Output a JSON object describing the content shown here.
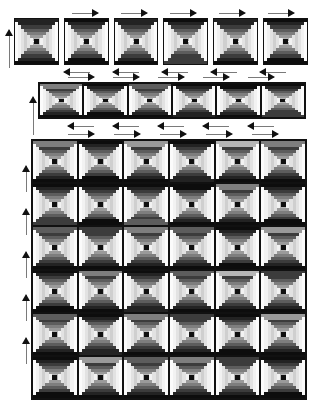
{
  "document": {
    "title": "Courthouse Steps Quilt Layout",
    "background": "#ffffff",
    "width": 321,
    "height": 408
  },
  "palette": {
    "outline": "#111111",
    "rule": "#7a7a7a",
    "tones": {
      "t0": "#f2f2f2",
      "t1": "#e2e2e2",
      "t2": "#cfcfcf",
      "t3": "#b5b5b5",
      "t4": "#9a9a9a",
      "t5": "#7e7e7e",
      "t6": "#5d5d5d",
      "t7": "#3c3c3c",
      "t8": "#232323",
      "t9": "#0d0d0d",
      "white": "#fbfbfb",
      "black": "#101010"
    }
  },
  "legend": {
    "block_style": "courthouse-steps",
    "ring_count": 7,
    "center_label": "center-square"
  },
  "panels": [
    {
      "id": "top-strip",
      "name": "block-preview-row",
      "x": 14,
      "y": 18,
      "w": 294,
      "h": 47,
      "cols": 6,
      "rows": 1,
      "gap": 5,
      "framed": false,
      "blocks": [
        {
          "i": 0,
          "dark": "t8",
          "light": "t2",
          "flip": "down"
        },
        {
          "i": 1,
          "dark": "t9",
          "light": "t1",
          "flip": "up"
        },
        {
          "i": 2,
          "dark": "t8",
          "light": "t2",
          "flip": "down"
        },
        {
          "i": 3,
          "dark": "t7",
          "light": "t1",
          "flip": "up"
        },
        {
          "i": 4,
          "dark": "t8",
          "light": "t2",
          "flip": "down"
        },
        {
          "i": 5,
          "dark": "t9",
          "light": "t1",
          "flip": "up"
        }
      ],
      "arrows_top": [
        {
          "x": 72,
          "y": 9,
          "w": 26,
          "dir": "right"
        },
        {
          "x": 121,
          "y": 9,
          "w": 26,
          "dir": "right"
        },
        {
          "x": 170,
          "y": 9,
          "w": 26,
          "dir": "right"
        },
        {
          "x": 219,
          "y": 9,
          "w": 26,
          "dir": "right"
        },
        {
          "x": 268,
          "y": 9,
          "w": 26,
          "dir": "right"
        }
      ],
      "arrows_bottom": [
        {
          "x": 64,
          "y": 68,
          "w": 26,
          "dir": "left"
        },
        {
          "x": 113,
          "y": 68,
          "w": 26,
          "dir": "left"
        },
        {
          "x": 162,
          "y": 68,
          "w": 26,
          "dir": "left"
        },
        {
          "x": 211,
          "y": 68,
          "w": 26,
          "dir": "left"
        },
        {
          "x": 260,
          "y": 68,
          "w": 26,
          "dir": "left"
        }
      ],
      "arrows_left": [
        {
          "x": 5,
          "y": 30,
          "h": 38,
          "dir": "up"
        }
      ]
    },
    {
      "id": "middle-strip",
      "name": "row-assembly-strip",
      "x": 38,
      "y": 82,
      "w": 268,
      "h": 37,
      "cols": 6,
      "rows": 1,
      "gap": 0,
      "framed": true,
      "blocks": [
        {
          "i": 0,
          "dark": "t5",
          "light": "t1",
          "flip": "down"
        },
        {
          "i": 1,
          "dark": "t9",
          "light": "t0",
          "flip": "up"
        },
        {
          "i": 2,
          "dark": "t6",
          "light": "t1",
          "flip": "down"
        },
        {
          "i": 3,
          "dark": "t8",
          "light": "t0",
          "flip": "up"
        },
        {
          "i": 4,
          "dark": "t9",
          "light": "t1",
          "flip": "down"
        },
        {
          "i": 5,
          "dark": "t7",
          "light": "t0",
          "flip": "up"
        }
      ],
      "arrows_top": [
        {
          "x": 68,
          "y": 73,
          "w": 26,
          "dir": "right"
        },
        {
          "x": 113,
          "y": 73,
          "w": 26,
          "dir": "right"
        },
        {
          "x": 158,
          "y": 73,
          "w": 26,
          "dir": "right"
        },
        {
          "x": 203,
          "y": 73,
          "w": 26,
          "dir": "right"
        },
        {
          "x": 248,
          "y": 73,
          "w": 26,
          "dir": "right"
        }
      ],
      "arrows_bottom": [
        {
          "x": 68,
          "y": 122,
          "w": 26,
          "dir": "left"
        },
        {
          "x": 113,
          "y": 122,
          "w": 26,
          "dir": "left"
        },
        {
          "x": 158,
          "y": 122,
          "w": 26,
          "dir": "left"
        },
        {
          "x": 203,
          "y": 122,
          "w": 26,
          "dir": "left"
        },
        {
          "x": 248,
          "y": 122,
          "w": 26,
          "dir": "left"
        }
      ],
      "arrows_left": [
        {
          "x": 29,
          "y": 97,
          "h": 38,
          "dir": "up"
        }
      ]
    },
    {
      "id": "main-grid",
      "name": "quilt-layout-grid",
      "x": 31,
      "y": 139,
      "w": 276,
      "h": 261,
      "cols": 6,
      "rows": 6,
      "gap": 0,
      "framed": true,
      "blocks": [
        {
          "i": 0,
          "dark": "t5",
          "light": "t1",
          "flip": "down"
        },
        {
          "i": 1,
          "dark": "t9",
          "light": "t0",
          "flip": "up"
        },
        {
          "i": 2,
          "dark": "t4",
          "light": "t1",
          "flip": "down"
        },
        {
          "i": 3,
          "dark": "t8",
          "light": "t0",
          "flip": "up"
        },
        {
          "i": 4,
          "dark": "t3",
          "light": "t1",
          "flip": "down"
        },
        {
          "i": 5,
          "dark": "t5",
          "light": "t0",
          "flip": "down"
        },
        {
          "i": 6,
          "dark": "t7",
          "light": "t0",
          "flip": "up"
        },
        {
          "i": 7,
          "dark": "t9",
          "light": "t1",
          "flip": "up"
        },
        {
          "i": 8,
          "dark": "t6",
          "light": "t0",
          "flip": "up"
        },
        {
          "i": 9,
          "dark": "t9",
          "light": "t1",
          "flip": "down"
        },
        {
          "i": 10,
          "dark": "t5",
          "light": "t0",
          "flip": "down"
        },
        {
          "i": 11,
          "dark": "t9",
          "light": "t1",
          "flip": "up"
        },
        {
          "i": 12,
          "dark": "t6",
          "light": "t1",
          "flip": "down"
        },
        {
          "i": 13,
          "dark": "t7",
          "light": "t0",
          "flip": "down"
        },
        {
          "i": 14,
          "dark": "t5",
          "light": "t1",
          "flip": "down"
        },
        {
          "i": 15,
          "dark": "t6",
          "light": "t0",
          "flip": "down"
        },
        {
          "i": 16,
          "dark": "t9",
          "light": "t1",
          "flip": "up"
        },
        {
          "i": 17,
          "dark": "t4",
          "light": "t0",
          "flip": "down"
        },
        {
          "i": 18,
          "dark": "t9",
          "light": "t0",
          "flip": "up"
        },
        {
          "i": 19,
          "dark": "t5",
          "light": "t1",
          "flip": "down"
        },
        {
          "i": 20,
          "dark": "t8",
          "light": "t0",
          "flip": "up"
        },
        {
          "i": 21,
          "dark": "t6",
          "light": "t1",
          "flip": "down"
        },
        {
          "i": 22,
          "dark": "t3",
          "light": "t0",
          "flip": "down"
        },
        {
          "i": 23,
          "dark": "t7",
          "light": "t1",
          "flip": "down"
        },
        {
          "i": 24,
          "dark": "t6",
          "light": "t0",
          "flip": "down"
        },
        {
          "i": 25,
          "dark": "t8",
          "light": "t1",
          "flip": "up"
        },
        {
          "i": 26,
          "dark": "t5",
          "light": "t0",
          "flip": "down"
        },
        {
          "i": 27,
          "dark": "t7",
          "light": "t1",
          "flip": "down"
        },
        {
          "i": 28,
          "dark": "t9",
          "light": "t0",
          "flip": "up"
        },
        {
          "i": 29,
          "dark": "t4",
          "light": "t1",
          "flip": "down"
        },
        {
          "i": 30,
          "dark": "t9",
          "light": "t0",
          "flip": "up"
        },
        {
          "i": 31,
          "dark": "t4",
          "light": "t1",
          "flip": "down"
        },
        {
          "i": 32,
          "dark": "t6",
          "light": "t0",
          "flip": "down"
        },
        {
          "i": 33,
          "dark": "t5",
          "light": "t1",
          "flip": "down"
        },
        {
          "i": 34,
          "dark": "t7",
          "light": "t0",
          "flip": "down"
        },
        {
          "i": 35,
          "dark": "t9",
          "light": "t1",
          "flip": "up"
        }
      ],
      "arrows_top": [
        {
          "x": 68,
          "y": 130,
          "w": 26,
          "dir": "right"
        },
        {
          "x": 114,
          "y": 130,
          "w": 26,
          "dir": "right"
        },
        {
          "x": 160,
          "y": 130,
          "w": 26,
          "dir": "right"
        },
        {
          "x": 206,
          "y": 130,
          "w": 26,
          "dir": "right"
        },
        {
          "x": 252,
          "y": 130,
          "w": 26,
          "dir": "right"
        }
      ],
      "arrows_left": [
        {
          "x": 22,
          "y": 166,
          "h": 26,
          "dir": "up"
        },
        {
          "x": 22,
          "y": 209,
          "h": 26,
          "dir": "up"
        },
        {
          "x": 22,
          "y": 252,
          "h": 26,
          "dir": "up"
        },
        {
          "x": 22,
          "y": 295,
          "h": 26,
          "dir": "up"
        },
        {
          "x": 22,
          "y": 338,
          "h": 26,
          "dir": "up"
        }
      ]
    }
  ]
}
